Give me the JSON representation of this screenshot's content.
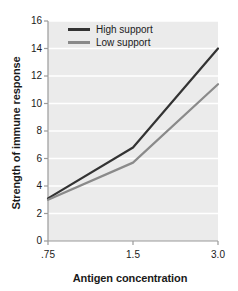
{
  "chart_data": {
    "type": "line",
    "title": "",
    "xlabel": "Antigen concentration",
    "ylabel": "Strength of immune response",
    "x": [
      0.75,
      1.5,
      3.0
    ],
    "xtick_labels": [
      ".75",
      "1.5",
      "3.0"
    ],
    "ylim": [
      0,
      16
    ],
    "ytick_values": [
      0,
      2,
      4,
      6,
      8,
      10,
      12,
      14,
      16
    ],
    "ytick_labels": [
      "0",
      "2",
      "4",
      "6",
      "8",
      "10",
      "12",
      "14",
      "16"
    ],
    "grid": "horizontal-white",
    "legend_position": "top-center",
    "series": [
      {
        "name": "High support",
        "values": [
          3.1,
          6.8,
          14.0
        ],
        "color": "#333333"
      },
      {
        "name": "Low support",
        "values": [
          3.0,
          5.7,
          11.4
        ],
        "color": "#8a8a8a"
      }
    ],
    "plot_background": "#ebebeb",
    "axis_color": "#9a9a9a",
    "text_color": "#1a1a1a"
  },
  "legend": {
    "items": [
      {
        "label": "High support"
      },
      {
        "label": "Low support"
      }
    ]
  }
}
